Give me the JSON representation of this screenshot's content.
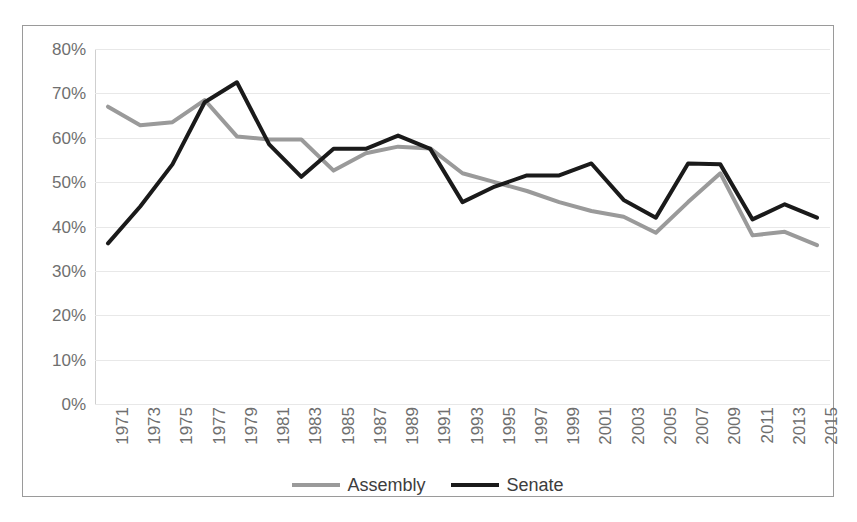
{
  "chart_data": {
    "type": "line",
    "title": "",
    "xlabel": "",
    "ylabel": "",
    "ylim": [
      0,
      0.8
    ],
    "ytick_labels": [
      "80%",
      "70%",
      "60%",
      "50%",
      "40%",
      "30%",
      "20%",
      "10%",
      "0%"
    ],
    "ytick_values": [
      80,
      70,
      60,
      50,
      40,
      30,
      20,
      10,
      0
    ],
    "grid": true,
    "legend_position": "bottom",
    "categories": [
      "1971",
      "1973",
      "1975",
      "1977",
      "1979",
      "1981",
      "1983",
      "1985",
      "1987",
      "1989",
      "1991",
      "1993",
      "1995",
      "1997",
      "1999",
      "2001",
      "2003",
      "2005",
      "2007",
      "2009",
      "2011",
      "2013",
      "2015"
    ],
    "series": [
      {
        "name": "Assembly",
        "color": "#9a9a9a",
        "values": [
          67.0,
          62.8,
          63.5,
          68.5,
          60.3,
          59.6,
          59.6,
          52.6,
          56.5,
          58.0,
          57.6,
          52.0,
          50.0,
          48.0,
          45.5,
          43.5,
          42.2,
          38.6,
          45.5,
          52.0,
          38.0,
          38.8,
          35.8
        ]
      },
      {
        "name": "Senate",
        "color": "#1a1a1a",
        "values": [
          36.2,
          44.5,
          54.0,
          68.0,
          72.5,
          58.5,
          51.2,
          57.5,
          57.5,
          60.5,
          57.5,
          45.5,
          49.0,
          51.5,
          51.5,
          54.2,
          46.0,
          42.0,
          54.2,
          54.0,
          41.6,
          45.0,
          42.0
        ]
      }
    ]
  },
  "legend": {
    "items": [
      {
        "label": "Assembly",
        "color": "#9a9a9a"
      },
      {
        "label": "Senate",
        "color": "#1a1a1a"
      }
    ]
  }
}
